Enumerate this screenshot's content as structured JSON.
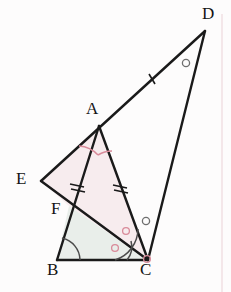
{
  "figure": {
    "type": "geometry-diagram",
    "width": 231,
    "height": 292,
    "background_color": "#fdfcfc",
    "stroke_color": "#1a1a1a"
  },
  "points": {
    "A": {
      "label": "A",
      "x": 99,
      "y": 126,
      "label_x": 86,
      "label_y": 103
    },
    "B": {
      "label": "B",
      "x": 57,
      "y": 260,
      "label_x": 49,
      "label_y": 262
    },
    "C": {
      "label": "C",
      "x": 148,
      "y": 260,
      "label_x": 141,
      "label_y": 262
    },
    "D": {
      "label": "D",
      "x": 205,
      "y": 31,
      "label_x": 204,
      "label_y": 8
    },
    "E": {
      "label": "E",
      "x": 41,
      "y": 181,
      "label_x": 18,
      "label_y": 168
    },
    "F": {
      "label": "F",
      "x": 69,
      "y": 206,
      "label_x": 53,
      "label_y": 200
    }
  },
  "segments": [
    {
      "name": "segment-E-D",
      "from": "E",
      "to": "D",
      "note": "long line through A"
    },
    {
      "name": "segment-E-C",
      "from": "E",
      "to": "C",
      "note": "passes through F"
    },
    {
      "name": "segment-A-C",
      "from": "A",
      "to": "C"
    },
    {
      "name": "segment-A-B",
      "from": "A",
      "to": "B",
      "note": "passes through F"
    },
    {
      "name": "segment-B-C",
      "from": "B",
      "to": "C"
    },
    {
      "name": "segment-D-C",
      "from": "D",
      "to": "C"
    }
  ],
  "tick_marks": [
    {
      "name": "tick-on-AD",
      "on": "A-D",
      "count": 1,
      "color": "#1a1a1a"
    },
    {
      "name": "tick-on-AF",
      "on": "A-F",
      "count": 2,
      "color": "#1a1a1a"
    },
    {
      "name": "tick-on-AC",
      "on": "A-C",
      "count": 2,
      "color": "#1a1a1a"
    }
  ],
  "angle_arcs": [
    {
      "name": "angle-arc-A-left",
      "at": "A",
      "color": "#d98b9a"
    },
    {
      "name": "angle-arc-A-right",
      "at": "A",
      "color": "#d98b9a"
    },
    {
      "name": "angle-arc-B",
      "at": "B",
      "color": "#4a4a4a"
    },
    {
      "name": "angle-arc-C-inner",
      "at": "C",
      "color": "#4a4a4a"
    },
    {
      "name": "angle-arc-C-outer",
      "at": "C",
      "color": "#4a4a4a"
    }
  ],
  "circle_markers": [
    {
      "name": "circle-marker-at-D",
      "x": 186,
      "y": 63,
      "color": "#6f6f6f"
    },
    {
      "name": "circle-marker-near-C-upper",
      "x": 146,
      "y": 221,
      "color": "#6f6f6f"
    },
    {
      "name": "circle-marker-near-C-mid",
      "x": 126,
      "y": 231,
      "color": "#d98b9a"
    },
    {
      "name": "circle-marker-near-C-lower",
      "x": 115,
      "y": 248,
      "color": "#d98b9a"
    },
    {
      "name": "circle-marker-at-C-base",
      "x": 147,
      "y": 258,
      "color": "#d98b9a"
    }
  ],
  "shaded_regions": [
    {
      "name": "region-A-E-F-C",
      "fill": "#f7ecee",
      "vertices": [
        "A",
        "E",
        "F",
        "C"
      ]
    },
    {
      "name": "region-F-B-C",
      "fill": "#e9eeea",
      "vertices": [
        "F",
        "B",
        "C"
      ]
    }
  ],
  "page_edge": {
    "name": "page-margin-line",
    "x": 222,
    "color": "#efdfe2"
  }
}
